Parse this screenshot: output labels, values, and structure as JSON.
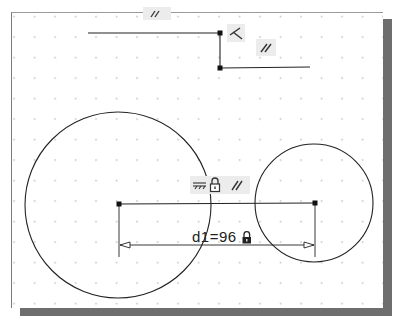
{
  "canvas": {
    "background": "#ffffff",
    "grid_spacing_px": 20.5,
    "grid_color": "#9a9a9a",
    "line_color": "#222222"
  },
  "sketch": {
    "top_profile": {
      "segments": [
        {
          "x1": 88,
          "y1": 33,
          "x2": 220,
          "y2": 33
        },
        {
          "x1": 220,
          "y1": 33,
          "x2": 220,
          "y2": 68
        },
        {
          "x1": 220,
          "y1": 68,
          "x2": 310,
          "y2": 67
        }
      ],
      "constraints": [
        {
          "type": "perpendicular-icon",
          "glyph": "⊥"
        },
        {
          "type": "parallel-icon",
          "glyph": "//"
        },
        {
          "type": "parallel-icon",
          "glyph": "//"
        }
      ]
    },
    "circles": [
      {
        "cx": 118,
        "cy": 205,
        "r": 93
      },
      {
        "cx": 314,
        "cy": 203,
        "r": 59
      }
    ],
    "center_line": {
      "x1": 119,
      "y1": 204,
      "x2": 315,
      "y2": 203
    },
    "center_line_constraints": [
      {
        "type": "horizontal-icon",
        "glyph": "⊤"
      },
      {
        "type": "lock-icon",
        "glyph": "🔒"
      },
      {
        "type": "parallel-icon",
        "glyph": "//"
      }
    ],
    "dimension": {
      "label": "d1=96",
      "name": "d1",
      "value": 96,
      "locked": true
    }
  }
}
